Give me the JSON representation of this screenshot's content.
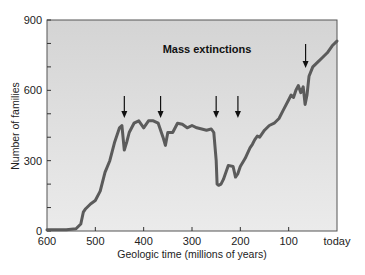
{
  "chart_data": {
    "type": "line",
    "title": "Mass extinctions",
    "xlabel": "Geologic time (millions of years)",
    "ylabel": "Number of families",
    "xlim": [
      600,
      0
    ],
    "ylim": [
      0,
      900
    ],
    "x_ticks": [
      "600",
      "500",
      "400",
      "300",
      "200",
      "100",
      "today"
    ],
    "y_ticks": [
      "0",
      "300",
      "600",
      "900"
    ],
    "grid": false,
    "background": "#d9d9d9",
    "line_color": "#595959",
    "series": [
      {
        "name": "Number of families",
        "x": [
          600,
          560,
          540,
          530,
          525,
          520,
          510,
          500,
          490,
          480,
          470,
          460,
          450,
          445,
          440,
          435,
          430,
          420,
          410,
          400,
          390,
          380,
          370,
          360,
          355,
          350,
          340,
          330,
          320,
          310,
          300,
          290,
          280,
          270,
          260,
          255,
          250,
          248,
          245,
          240,
          235,
          225,
          215,
          210,
          205,
          200,
          190,
          180,
          175,
          170,
          165,
          160,
          150,
          140,
          130,
          120,
          110,
          100,
          95,
          90,
          85,
          80,
          75,
          70,
          66,
          62,
          58,
          50,
          40,
          30,
          20,
          10,
          0
        ],
        "y": [
          5,
          5,
          10,
          30,
          80,
          95,
          115,
          130,
          170,
          250,
          300,
          380,
          440,
          450,
          345,
          380,
          420,
          460,
          470,
          440,
          470,
          470,
          460,
          400,
          365,
          420,
          420,
          460,
          455,
          440,
          450,
          440,
          435,
          430,
          435,
          420,
          300,
          200,
          195,
          200,
          220,
          280,
          275,
          230,
          245,
          275,
          310,
          355,
          370,
          390,
          405,
          400,
          430,
          450,
          460,
          480,
          520,
          560,
          580,
          570,
          600,
          620,
          590,
          615,
          540,
          580,
          660,
          700,
          720,
          740,
          760,
          790,
          810
        ]
      }
    ],
    "annotations": [
      {
        "text": "Mass extinctions",
        "arrows_at_x": [
          440,
          365,
          250,
          205,
          65
        ]
      }
    ]
  }
}
